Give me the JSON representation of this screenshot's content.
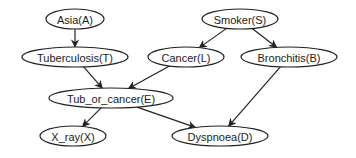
{
  "diagram": {
    "type": "bayesian-network",
    "nodes": [
      {
        "id": "A",
        "label": "Asia(A)",
        "cx": 75,
        "cy": 19,
        "rx": 29,
        "ry": 10
      },
      {
        "id": "S",
        "label": "Smoker(S)",
        "cx": 240,
        "cy": 19,
        "rx": 38,
        "ry": 10
      },
      {
        "id": "T",
        "label": "Tuberculosis(T)",
        "cx": 75,
        "cy": 57,
        "rx": 53,
        "ry": 10
      },
      {
        "id": "L",
        "label": "Cancer(L)",
        "cx": 186,
        "cy": 57,
        "rx": 38,
        "ry": 10
      },
      {
        "id": "B",
        "label": "Bronchitis(B)",
        "cx": 289,
        "cy": 57,
        "rx": 48,
        "ry": 10
      },
      {
        "id": "E",
        "label": "Tub_or_cancer(E)",
        "cx": 111,
        "cy": 98,
        "rx": 62,
        "ry": 10
      },
      {
        "id": "X",
        "label": "X_ray(X)",
        "cx": 73,
        "cy": 136,
        "rx": 33,
        "ry": 10
      },
      {
        "id": "D",
        "label": "Dyspnoea(D)",
        "cx": 220,
        "cy": 136,
        "rx": 48,
        "ry": 10
      }
    ],
    "edges": [
      {
        "from": "A",
        "to": "T"
      },
      {
        "from": "S",
        "to": "L"
      },
      {
        "from": "S",
        "to": "B"
      },
      {
        "from": "T",
        "to": "E"
      },
      {
        "from": "L",
        "to": "E"
      },
      {
        "from": "E",
        "to": "X"
      },
      {
        "from": "E",
        "to": "D"
      },
      {
        "from": "B",
        "to": "D"
      }
    ],
    "colors": {
      "stroke": "#222222",
      "fill": "#ffffff",
      "background": "#ffffff"
    }
  }
}
